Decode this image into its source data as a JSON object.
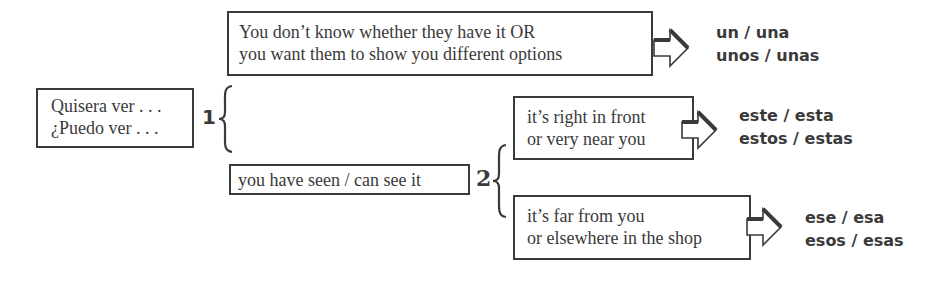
{
  "diagram": {
    "start_box": {
      "lines": [
        "Quisera ver . . .",
        "¿Puedo ver . . ."
      ]
    },
    "branch_1": {
      "number": "1",
      "condition_box": {
        "lines": [
          "You don’t know whether they have it  OR",
          "you want them to show you different options"
        ]
      },
      "result": {
        "lines": [
          "un / una",
          "unos / unas"
        ]
      }
    },
    "branch_2": {
      "condition_box": {
        "lines": [
          "you have seen / can see it"
        ]
      },
      "number": "2",
      "sub_branches": [
        {
          "condition_lines": [
            "it’s right in front",
            "or very near you"
          ],
          "result_lines": [
            "este / esta",
            "estos / estas"
          ]
        },
        {
          "condition_lines": [
            "it’s far from you",
            "or elsewhere in the shop"
          ],
          "result_lines": [
            "ese / esa",
            "esos / esas"
          ]
        }
      ]
    },
    "colors": {
      "ink": "#3a3a3a",
      "background": "#ffffff"
    }
  }
}
